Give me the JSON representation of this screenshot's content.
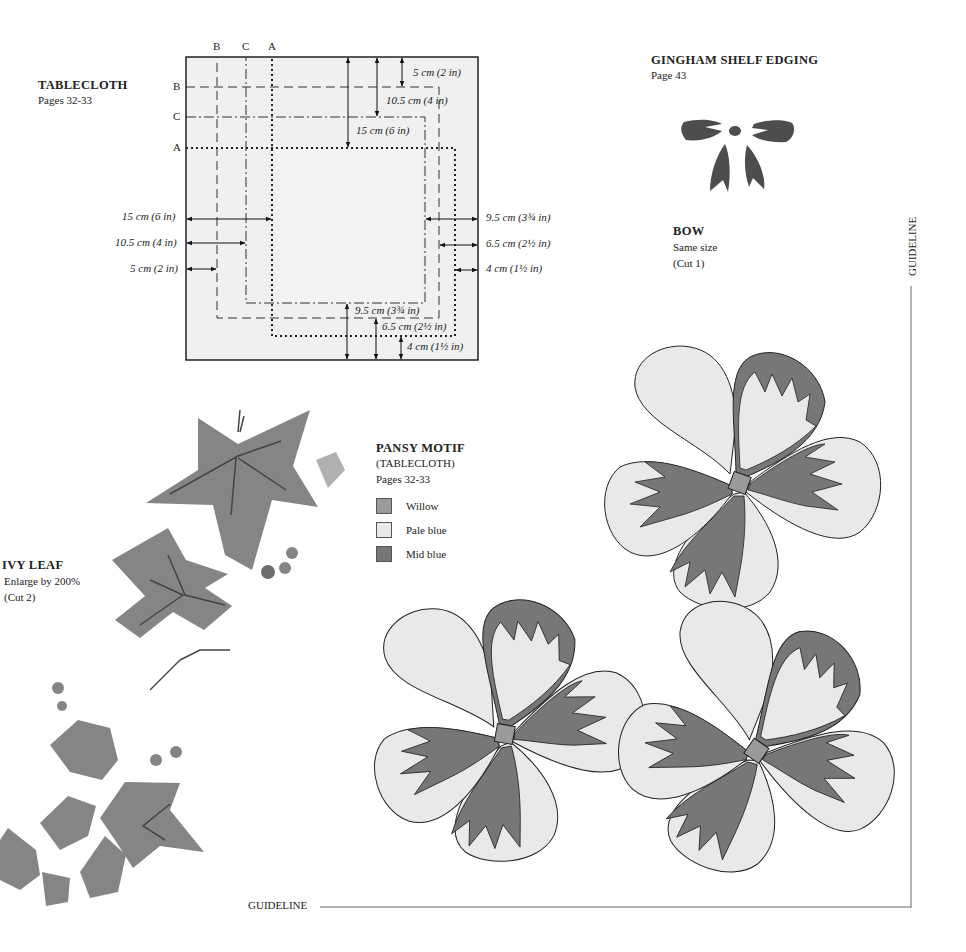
{
  "tablecloth": {
    "title": "TABLECLOTH",
    "pages": "Pages 32-33",
    "line_labels": {
      "top": [
        "B",
        "C",
        "A"
      ],
      "left": [
        "B",
        "C",
        "A"
      ]
    },
    "dims_top": [
      "5 cm (2 in)",
      "10.5 cm (4 in)",
      "15 cm (6 in)"
    ],
    "dims_left": [
      "15 cm (6 in)",
      "10.5 cm (4 in)",
      "5 cm (2 in)"
    ],
    "dims_right": [
      "9.5 cm (3¾ in)",
      "6.5 cm (2½ in)",
      "4 cm (1½ in)"
    ],
    "dims_bottom": [
      "9.5 cm (3¾ in)",
      "6.5 cm (2½ in)",
      "4 cm (1½ in)"
    ]
  },
  "gingham": {
    "title": "GINGHAM SHELF EDGING",
    "pages": "Page 43"
  },
  "bow": {
    "title": "BOW",
    "size": "Same size",
    "cut": "(Cut 1)"
  },
  "ivy": {
    "title": "IVY LEAF",
    "enlarge": "Enlarge by 200%",
    "cut": "(Cut 2)"
  },
  "pansy": {
    "title": "PANSY MOTIF",
    "subtitle": "(TABLECLOTH)",
    "pages": "Pages 32-33",
    "legend": [
      {
        "label": "Willow",
        "color": "#9a9a9a"
      },
      {
        "label": "Pale blue",
        "color": "#e9e9e9"
      },
      {
        "label": "Mid blue",
        "color": "#777777"
      }
    ]
  },
  "guidelines": {
    "vertical": "GUIDELINE",
    "horizontal": "GUIDELINE"
  },
  "colors": {
    "mid_blue": "#777777",
    "willow": "#9a9a9a",
    "pale_blue": "#e9e9e9",
    "diagram_bg": "#f0f0f0",
    "leaf": "#858585"
  }
}
